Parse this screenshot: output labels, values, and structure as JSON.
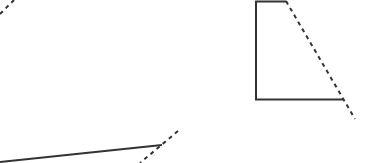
{
  "canvas": {
    "width": 366,
    "height": 163,
    "background": "#ffffff"
  },
  "colors": {
    "stroke": "#333333"
  },
  "shapes": {
    "top_left_dashed": {
      "x1": 0,
      "y1": 14,
      "x2": 14,
      "y2": 0
    },
    "right_shape": {
      "solid_path": "M286,1.5 L256,1.5 L256,99.5 L343,99.5",
      "dashed": {
        "x1": 286,
        "y1": 1,
        "x2": 355,
        "y2": 119
      }
    },
    "bottom": {
      "solid": {
        "x1": 0,
        "y1": 162,
        "x2": 162,
        "y2": 145
      },
      "dashed": {
        "x1": 178,
        "y1": 131,
        "x2": 140,
        "y2": 163
      }
    }
  }
}
